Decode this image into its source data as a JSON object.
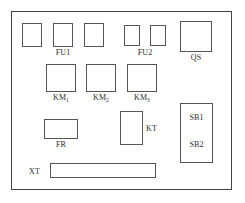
{
  "diagram": {
    "enclosure_name": "control-cabinet-frame",
    "line_color": "#555555",
    "frame_color": "#444444",
    "background_color": "#ffffff",
    "text_color": "#2b2b2b"
  },
  "components": {
    "fu1": {
      "label": "FU1",
      "type": "fuse-group",
      "count": 3
    },
    "fu2": {
      "label": "FU2",
      "type": "fuse-group",
      "count": 2
    },
    "qs": {
      "label": "QS",
      "type": "isolator-switch"
    },
    "km1": {
      "label_main": "KM",
      "label_sub": "1",
      "type": "contactor"
    },
    "km2": {
      "label_main": "KM",
      "label_sub": "2",
      "type": "contactor"
    },
    "km3": {
      "label_main": "KM",
      "label_sub": "3",
      "type": "contactor"
    },
    "fr": {
      "label": "FR",
      "type": "thermal-relay"
    },
    "kt": {
      "label": "KT",
      "type": "time-relay"
    },
    "sb": {
      "label_1": "SB1",
      "label_2": "SB2",
      "type": "push-button-station"
    },
    "xt": {
      "label": "XT",
      "type": "terminal-block"
    }
  }
}
